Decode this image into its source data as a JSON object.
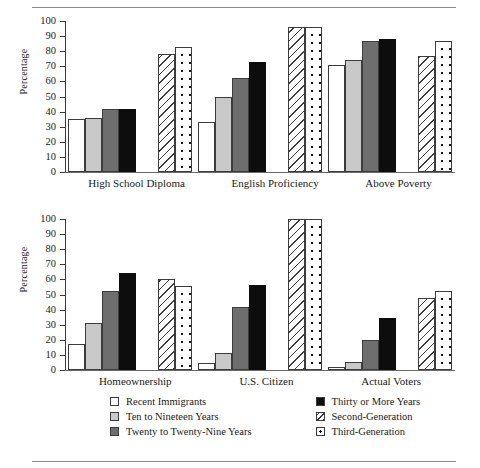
{
  "chart_data": [
    {
      "type": "bar",
      "title": "",
      "xlabel": "",
      "ylabel": "Percentage",
      "ylim": [
        0,
        100
      ],
      "yticks": [
        0,
        10,
        20,
        30,
        40,
        50,
        60,
        70,
        80,
        90,
        100
      ],
      "grid": false,
      "legend_position": "bottom",
      "categories": [
        "High School Diploma",
        "English Proficiency",
        "Above Poverty"
      ],
      "series": [
        {
          "name": "Recent Immigrants",
          "values": [
            35,
            33,
            71
          ]
        },
        {
          "name": "Ten to Nineteen Years",
          "values": [
            35.5,
            49.5,
            74.5
          ]
        },
        {
          "name": "Twenty to Twenty-Nine Years",
          "values": [
            42,
            62,
            87
          ]
        },
        {
          "name": "Thirty or More Years",
          "values": [
            42,
            73,
            88
          ]
        },
        {
          "name": "Second-Generation",
          "values": [
            78,
            96,
            77
          ]
        },
        {
          "name": "Third-Generation",
          "values": [
            82.5,
            96,
            86.5
          ]
        }
      ]
    },
    {
      "type": "bar",
      "title": "",
      "xlabel": "",
      "ylabel": "Percentage",
      "ylim": [
        0,
        100
      ],
      "yticks": [
        0,
        10,
        20,
        30,
        40,
        50,
        60,
        70,
        80,
        90,
        100
      ],
      "grid": false,
      "legend_position": "bottom",
      "categories": [
        "Homeownership",
        "U.S. Citizen",
        "Actual Voters"
      ],
      "series": [
        {
          "name": "Recent Immigrants",
          "values": [
            17,
            4.5,
            2
          ]
        },
        {
          "name": "Ten to Nineteen Years",
          "values": [
            31,
            11,
            5.5
          ]
        },
        {
          "name": "Twenty to Twenty-Nine Years",
          "values": [
            52,
            41.5,
            20
          ]
        },
        {
          "name": "Thirty or More Years",
          "values": [
            64,
            56.5,
            34.5
          ]
        },
        {
          "name": "Second-Generation",
          "values": [
            60,
            100,
            47.5
          ]
        },
        {
          "name": "Third-Generation",
          "values": [
            55.5,
            100,
            52
          ]
        }
      ]
    }
  ],
  "panel1": {
    "ylabel": "Percentage",
    "yticks": [
      "100",
      "90",
      "80",
      "70",
      "60",
      "50",
      "40",
      "30",
      "20",
      "10",
      "0"
    ],
    "categories": [
      "High School Diploma",
      "English Proficiency",
      "Above Poverty"
    ]
  },
  "panel2": {
    "ylabel": "Percentage",
    "yticks": [
      "100",
      "90",
      "80",
      "70",
      "60",
      "50",
      "40",
      "30",
      "20",
      "10",
      "0"
    ],
    "categories": [
      "Homeownership",
      "U.S. Citizen",
      "Actual Voters"
    ]
  },
  "legend": {
    "left": [
      {
        "label": "Recent Immigrants",
        "swatch": "white-square"
      },
      {
        "label": "Ten to Nineteen Years",
        "swatch": "light-gray-square"
      },
      {
        "label": "Twenty to Twenty-Nine Years",
        "swatch": "medium-gray-square"
      }
    ],
    "right": [
      {
        "label": "Thirty or More Years",
        "swatch": "black-square"
      },
      {
        "label": "Second-Generation",
        "swatch": "diagonal-hatch-square"
      },
      {
        "label": "Third-Generation",
        "swatch": "dotted-square"
      }
    ]
  },
  "colors": {
    "recent": "#ffffff",
    "ten_nineteen": "#c9c9c9",
    "twenty_twentynine": "#6e6e6e",
    "thirty_more": "#0d0d0d",
    "outline": "#3c3c3c"
  }
}
